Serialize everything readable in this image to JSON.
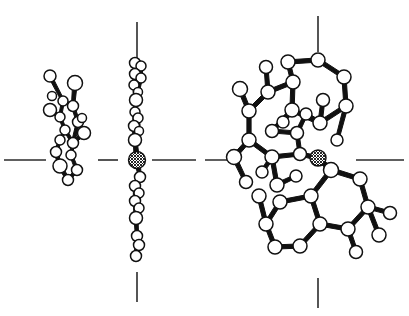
{
  "figure": {
    "background_color": "#ffffff",
    "line_color": "#111111",
    "atom_fill_color": "#ffffff",
    "metal_fill_pattern": "cross-hatch",
    "width": 409,
    "height": 316
  },
  "axis_ticks": {
    "color": "#2b2b2b",
    "marks": [
      {
        "name": "left-horizontal-tick",
        "orientation": "horizontal",
        "x1": 4,
        "y1": 160,
        "x2": 46,
        "y2": 160
      },
      {
        "name": "center-left-horizontal-tick",
        "orientation": "horizontal",
        "x1": 98,
        "y1": 160,
        "x2": 118,
        "y2": 160
      },
      {
        "name": "center-right-horizontal-tick",
        "orientation": "horizontal",
        "x1": 152,
        "y1": 160,
        "x2": 196,
        "y2": 160
      },
      {
        "name": "right-inner-horizontal-tick",
        "orientation": "horizontal",
        "x1": 205,
        "y1": 160,
        "x2": 240,
        "y2": 160
      },
      {
        "name": "right-outer-horizontal-tick",
        "orientation": "horizontal",
        "x1": 356,
        "y1": 160,
        "x2": 404,
        "y2": 160
      },
      {
        "name": "center-top-vertical-tick",
        "orientation": "vertical",
        "x1": 137,
        "y1": 22,
        "x2": 137,
        "y2": 64
      },
      {
        "name": "center-bottom-vertical-tick",
        "orientation": "vertical",
        "x1": 137,
        "y1": 272,
        "x2": 137,
        "y2": 302
      },
      {
        "name": "right-top-vertical-tick",
        "orientation": "vertical",
        "x1": 318,
        "y1": 16,
        "x2": 318,
        "y2": 52
      },
      {
        "name": "right-bottom-vertical-tick",
        "orientation": "vertical",
        "x1": 318,
        "y1": 278,
        "x2": 318,
        "y2": 308
      }
    ]
  },
  "views": [
    {
      "name": "left-projection",
      "label": "left edge-on projection",
      "description": "Compressed side view of the ligand framework",
      "atom_count": 18
    },
    {
      "name": "center-projection",
      "label": "center edge-on projection",
      "description": "Near-perfectly edge-on view showing planar stacking with metal atom at center",
      "atom_count": 22
    },
    {
      "name": "right-projection",
      "label": "right face-on projection",
      "description": "Face-on view resolving fused aromatic rings and metal coordination",
      "atom_count": 40
    }
  ],
  "structure_data": {
    "left_atoms": [
      {
        "id": "L1",
        "cx": 50,
        "cy": 76,
        "r": 6.0,
        "type": "light"
      },
      {
        "id": "L2",
        "cx": 75,
        "cy": 83,
        "r": 7.5,
        "type": "light"
      },
      {
        "id": "L3",
        "cx": 63,
        "cy": 101,
        "r": 5.0,
        "type": "light"
      },
      {
        "id": "L4",
        "cx": 73,
        "cy": 106,
        "r": 5.5,
        "type": "light"
      },
      {
        "id": "L5",
        "cx": 50,
        "cy": 110,
        "r": 6.5,
        "type": "light"
      },
      {
        "id": "L6",
        "cx": 60,
        "cy": 117,
        "r": 5.0,
        "type": "light"
      },
      {
        "id": "L7",
        "cx": 78,
        "cy": 122,
        "r": 5.5,
        "type": "light"
      },
      {
        "id": "L8",
        "cx": 65,
        "cy": 130,
        "r": 5.0,
        "type": "light"
      },
      {
        "id": "L9",
        "cx": 84,
        "cy": 133,
        "r": 6.5,
        "type": "light"
      },
      {
        "id": "L10",
        "cx": 60,
        "cy": 140,
        "r": 5.0,
        "type": "light"
      },
      {
        "id": "L11",
        "cx": 73,
        "cy": 143,
        "r": 5.5,
        "type": "light"
      },
      {
        "id": "L12",
        "cx": 56,
        "cy": 152,
        "r": 5.5,
        "type": "light"
      },
      {
        "id": "L13",
        "cx": 71,
        "cy": 155,
        "r": 5.0,
        "type": "light"
      },
      {
        "id": "L14",
        "cx": 60,
        "cy": 166,
        "r": 7.0,
        "type": "light"
      },
      {
        "id": "L15",
        "cx": 77,
        "cy": 170,
        "r": 5.5,
        "type": "light"
      },
      {
        "id": "L16",
        "cx": 68,
        "cy": 180,
        "r": 5.5,
        "type": "light"
      },
      {
        "id": "L17",
        "cx": 82,
        "cy": 118,
        "r": 4.5,
        "type": "light"
      },
      {
        "id": "L18",
        "cx": 52,
        "cy": 96,
        "r": 4.5,
        "type": "light"
      }
    ],
    "left_bonds": [
      [
        "L1",
        "L3"
      ],
      [
        "L2",
        "L4"
      ],
      [
        "L3",
        "L4"
      ],
      [
        "L5",
        "L6"
      ],
      [
        "L6",
        "L3"
      ],
      [
        "L4",
        "L7"
      ],
      [
        "L6",
        "L8"
      ],
      [
        "L7",
        "L9"
      ],
      [
        "L8",
        "L10"
      ],
      [
        "L7",
        "L11"
      ],
      [
        "L10",
        "L12"
      ],
      [
        "L11",
        "L13"
      ],
      [
        "L12",
        "L14"
      ],
      [
        "L13",
        "L15"
      ],
      [
        "L14",
        "L16"
      ],
      [
        "L15",
        "L16"
      ],
      [
        "L11",
        "L9"
      ],
      [
        "L8",
        "L11"
      ]
    ],
    "center_atoms": [
      {
        "id": "C1",
        "cx": 135,
        "cy": 63,
        "r": 5.5,
        "type": "light"
      },
      {
        "id": "C2",
        "cx": 141,
        "cy": 66,
        "r": 5.0,
        "type": "light"
      },
      {
        "id": "C3",
        "cx": 135,
        "cy": 74,
        "r": 5.5,
        "type": "light"
      },
      {
        "id": "C4",
        "cx": 141,
        "cy": 78,
        "r": 5.0,
        "type": "light"
      },
      {
        "id": "C5",
        "cx": 134,
        "cy": 85,
        "r": 5.0,
        "type": "light"
      },
      {
        "id": "C6",
        "cx": 138,
        "cy": 92,
        "r": 4.5,
        "type": "light"
      },
      {
        "id": "C7",
        "cx": 136,
        "cy": 100,
        "r": 6.5,
        "type": "light"
      },
      {
        "id": "C8",
        "cx": 135,
        "cy": 112,
        "r": 5.0,
        "type": "light"
      },
      {
        "id": "C9",
        "cx": 138,
        "cy": 118,
        "r": 5.0,
        "type": "light"
      },
      {
        "id": "C10",
        "cx": 134,
        "cy": 126,
        "r": 5.5,
        "type": "light"
      },
      {
        "id": "C11",
        "cx": 139,
        "cy": 131,
        "r": 4.5,
        "type": "light"
      },
      {
        "id": "C12",
        "cx": 135,
        "cy": 140,
        "r": 6.5,
        "type": "light"
      },
      {
        "id": "C13",
        "cx": 137,
        "cy": 160,
        "r": 8.5,
        "type": "metal"
      },
      {
        "id": "C14",
        "cx": 140,
        "cy": 177,
        "r": 5.5,
        "type": "light"
      },
      {
        "id": "C15",
        "cx": 135,
        "cy": 186,
        "r": 5.5,
        "type": "light"
      },
      {
        "id": "C16",
        "cx": 139,
        "cy": 193,
        "r": 5.0,
        "type": "light"
      },
      {
        "id": "C17",
        "cx": 135,
        "cy": 201,
        "r": 5.5,
        "type": "light"
      },
      {
        "id": "C18",
        "cx": 139,
        "cy": 208,
        "r": 5.0,
        "type": "light"
      },
      {
        "id": "C19",
        "cx": 136,
        "cy": 218,
        "r": 6.5,
        "type": "light"
      },
      {
        "id": "C20",
        "cx": 137,
        "cy": 236,
        "r": 5.5,
        "type": "light"
      },
      {
        "id": "C21",
        "cx": 139,
        "cy": 245,
        "r": 5.5,
        "type": "light"
      },
      {
        "id": "C22",
        "cx": 136,
        "cy": 256,
        "r": 5.5,
        "type": "light"
      }
    ],
    "center_bonds": [
      [
        "C1",
        "C3"
      ],
      [
        "C3",
        "C5"
      ],
      [
        "C5",
        "C7"
      ],
      [
        "C7",
        "C8"
      ],
      [
        "C8",
        "C10"
      ],
      [
        "C10",
        "C12"
      ],
      [
        "C12",
        "C13"
      ],
      [
        "C13",
        "C14"
      ],
      [
        "C14",
        "C15"
      ],
      [
        "C15",
        "C17"
      ],
      [
        "C17",
        "C19"
      ],
      [
        "C19",
        "C20"
      ],
      [
        "C20",
        "C22"
      ],
      [
        "C2",
        "C4"
      ],
      [
        "C4",
        "C6"
      ],
      [
        "C9",
        "C11"
      ],
      [
        "C16",
        "C18"
      ],
      [
        "C21",
        "C22"
      ]
    ],
    "right_atoms": [
      {
        "id": "R1",
        "cx": 288,
        "cy": 62,
        "r": 7.0,
        "type": "light"
      },
      {
        "id": "R2",
        "cx": 318,
        "cy": 60,
        "r": 7.0,
        "type": "light"
      },
      {
        "id": "R3",
        "cx": 344,
        "cy": 77,
        "r": 7.0,
        "type": "light"
      },
      {
        "id": "R4",
        "cx": 346,
        "cy": 106,
        "r": 7.0,
        "type": "light"
      },
      {
        "id": "R5",
        "cx": 320,
        "cy": 123,
        "r": 7.0,
        "type": "light"
      },
      {
        "id": "R6",
        "cx": 292,
        "cy": 110,
        "r": 7.0,
        "type": "light"
      },
      {
        "id": "R7",
        "cx": 293,
        "cy": 82,
        "r": 7.0,
        "type": "light"
      },
      {
        "id": "R8",
        "cx": 268,
        "cy": 92,
        "r": 7.0,
        "type": "light"
      },
      {
        "id": "R9",
        "cx": 249,
        "cy": 111,
        "r": 7.0,
        "type": "light"
      },
      {
        "id": "R10",
        "cx": 240,
        "cy": 89,
        "r": 7.5,
        "type": "light"
      },
      {
        "id": "R11",
        "cx": 249,
        "cy": 140,
        "r": 7.0,
        "type": "light"
      },
      {
        "id": "R12",
        "cx": 234,
        "cy": 157,
        "r": 7.5,
        "type": "light"
      },
      {
        "id": "R13",
        "cx": 272,
        "cy": 157,
        "r": 7.0,
        "type": "light"
      },
      {
        "id": "R14",
        "cx": 277,
        "cy": 185,
        "r": 7.0,
        "type": "light"
      },
      {
        "id": "R15",
        "cx": 272,
        "cy": 131,
        "r": 6.5,
        "type": "light"
      },
      {
        "id": "R16",
        "cx": 297,
        "cy": 133,
        "r": 6.5,
        "type": "light"
      },
      {
        "id": "R17",
        "cx": 300,
        "cy": 154,
        "r": 6.5,
        "type": "light"
      },
      {
        "id": "R18",
        "cx": 318,
        "cy": 158,
        "r": 8.0,
        "type": "metal"
      },
      {
        "id": "R19",
        "cx": 331,
        "cy": 170,
        "r": 7.5,
        "type": "light"
      },
      {
        "id": "R20",
        "cx": 360,
        "cy": 179,
        "r": 7.0,
        "type": "light"
      },
      {
        "id": "R21",
        "cx": 368,
        "cy": 207,
        "r": 7.0,
        "type": "light"
      },
      {
        "id": "R22",
        "cx": 348,
        "cy": 229,
        "r": 7.0,
        "type": "light"
      },
      {
        "id": "R23",
        "cx": 320,
        "cy": 224,
        "r": 7.0,
        "type": "light"
      },
      {
        "id": "R24",
        "cx": 311,
        "cy": 196,
        "r": 7.0,
        "type": "light"
      },
      {
        "id": "R25",
        "cx": 300,
        "cy": 246,
        "r": 7.0,
        "type": "light"
      },
      {
        "id": "R26",
        "cx": 275,
        "cy": 247,
        "r": 7.0,
        "type": "light"
      },
      {
        "id": "R27",
        "cx": 266,
        "cy": 224,
        "r": 7.0,
        "type": "light"
      },
      {
        "id": "R28",
        "cx": 280,
        "cy": 202,
        "r": 7.0,
        "type": "light"
      },
      {
        "id": "R29",
        "cx": 259,
        "cy": 196,
        "r": 7.0,
        "type": "light"
      },
      {
        "id": "R30",
        "cx": 379,
        "cy": 235,
        "r": 7.0,
        "type": "light"
      },
      {
        "id": "R31",
        "cx": 390,
        "cy": 213,
        "r": 6.5,
        "type": "light"
      },
      {
        "id": "R32",
        "cx": 356,
        "cy": 252,
        "r": 6.5,
        "type": "light"
      },
      {
        "id": "R33",
        "cx": 246,
        "cy": 182,
        "r": 6.5,
        "type": "light"
      },
      {
        "id": "R34",
        "cx": 296,
        "cy": 176,
        "r": 6.0,
        "type": "light"
      },
      {
        "id": "R35",
        "cx": 266,
        "cy": 67,
        "r": 6.5,
        "type": "light"
      },
      {
        "id": "R36",
        "cx": 323,
        "cy": 100,
        "r": 6.5,
        "type": "light"
      },
      {
        "id": "R37",
        "cx": 283,
        "cy": 122,
        "r": 6.0,
        "type": "light"
      },
      {
        "id": "R38",
        "cx": 262,
        "cy": 172,
        "r": 6.0,
        "type": "light"
      },
      {
        "id": "R39",
        "cx": 306,
        "cy": 114,
        "r": 6.0,
        "type": "light"
      },
      {
        "id": "R40",
        "cx": 337,
        "cy": 140,
        "r": 6.0,
        "type": "light"
      }
    ],
    "right_bonds": [
      [
        "R1",
        "R2"
      ],
      [
        "R2",
        "R3"
      ],
      [
        "R3",
        "R4"
      ],
      [
        "R4",
        "R5"
      ],
      [
        "R5",
        "R6"
      ],
      [
        "R6",
        "R7"
      ],
      [
        "R7",
        "R1"
      ],
      [
        "R7",
        "R8"
      ],
      [
        "R8",
        "R9"
      ],
      [
        "R9",
        "R10"
      ],
      [
        "R9",
        "R11"
      ],
      [
        "R11",
        "R12"
      ],
      [
        "R11",
        "R13"
      ],
      [
        "R13",
        "R14"
      ],
      [
        "R8",
        "R35"
      ],
      [
        "R5",
        "R36"
      ],
      [
        "R6",
        "R37"
      ],
      [
        "R15",
        "R16"
      ],
      [
        "R16",
        "R17"
      ],
      [
        "R17",
        "R18"
      ],
      [
        "R18",
        "R19"
      ],
      [
        "R19",
        "R20"
      ],
      [
        "R20",
        "R21"
      ],
      [
        "R21",
        "R22"
      ],
      [
        "R22",
        "R23"
      ],
      [
        "R23",
        "R24"
      ],
      [
        "R24",
        "R19"
      ],
      [
        "R23",
        "R25"
      ],
      [
        "R25",
        "R26"
      ],
      [
        "R26",
        "R27"
      ],
      [
        "R27",
        "R28"
      ],
      [
        "R28",
        "R24"
      ],
      [
        "R27",
        "R29"
      ],
      [
        "R21",
        "R31"
      ],
      [
        "R22",
        "R32"
      ],
      [
        "R30",
        "R21"
      ],
      [
        "R12",
        "R33"
      ],
      [
        "R14",
        "R34"
      ],
      [
        "R13",
        "R38"
      ],
      [
        "R5",
        "R39"
      ],
      [
        "R4",
        "R40"
      ],
      [
        "R15",
        "R6"
      ],
      [
        "R16",
        "R39"
      ],
      [
        "R17",
        "R13"
      ]
    ]
  }
}
